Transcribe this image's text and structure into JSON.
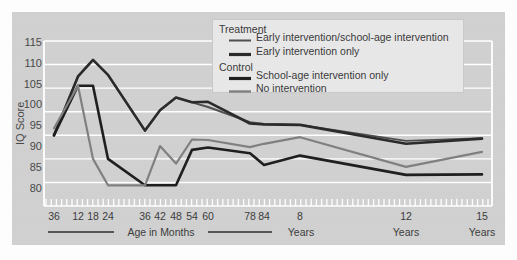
{
  "chart_data": {
    "type": "line",
    "title": "",
    "subtitle": "",
    "xlabel_groups": [
      "Age in Months",
      "Years",
      "Years",
      "Years"
    ],
    "ylabel": "IQ Score",
    "ylim": [
      80,
      115
    ],
    "yticks": [
      80,
      85,
      90,
      95,
      100,
      105,
      110,
      115
    ],
    "grid": "horizontal-white",
    "legend_position": "top-center",
    "x_tick_labels": [
      "36",
      "12",
      "18",
      "24",
      "36",
      "42",
      "48",
      "54",
      "60",
      "78",
      "84",
      "8",
      "12",
      "15"
    ],
    "x_tick_units": [
      "months",
      "months",
      "months",
      "months",
      "months",
      "months",
      "months",
      "months",
      "months",
      "months",
      "months",
      "years",
      "years",
      "years"
    ],
    "legend": {
      "groups": [
        {
          "heading": "Treatment",
          "entries": [
            {
              "label": "Early intervention/school-age intervention",
              "color": "#4f4f4f",
              "weight": 2.0
            },
            {
              "label": "Early intervention only",
              "color": "#2b2b2b",
              "weight": 3.0
            }
          ]
        },
        {
          "heading": "Control",
          "entries": [
            {
              "label": "School-age intervention only",
              "color": "#1f1f1f",
              "weight": 3.0
            },
            {
              "label": "No intervention",
              "color": "#808080",
              "weight": 2.2
            }
          ]
        }
      ]
    },
    "x": [
      "36m",
      "12",
      "18",
      "24",
      "36",
      "42",
      "48",
      "54",
      "60",
      "78",
      "84",
      "8y",
      "12y",
      "15y"
    ],
    "series": [
      {
        "name": "Early intervention/school-age intervention",
        "color": "#4f4f4f",
        "width": 1.9,
        "values": [
          95.0,
          107.5,
          111.0,
          107.8,
          96.0,
          100.3,
          103.0,
          102.0,
          101.0,
          97.8,
          97.4,
          97.2,
          93.8,
          94.4
        ]
      },
      {
        "name": "Early intervention only",
        "color": "#2b2b2b",
        "width": 2.6,
        "values": [
          95.0,
          107.5,
          111.0,
          107.8,
          96.0,
          100.3,
          103.0,
          102.0,
          102.1,
          97.5,
          97.3,
          97.2,
          93.2,
          94.3
        ]
      },
      {
        "name": "School-age intervention only",
        "color": "#1f1f1f",
        "width": 2.6,
        "values": [
          95.0,
          105.5,
          105.5,
          90.0,
          84.4,
          84.4,
          84.4,
          91.9,
          92.4,
          91.2,
          88.7,
          90.7,
          86.6,
          86.7
        ]
      },
      {
        "name": "No intervention",
        "color": "#808080",
        "width": 2.2,
        "values": [
          96.5,
          105.5,
          90.0,
          84.4,
          84.4,
          92.7,
          89.0,
          94.1,
          94.0,
          92.5,
          93.2,
          94.6,
          88.3,
          91.5
        ]
      }
    ],
    "x_positions": [
      54,
      78,
      93,
      108,
      145,
      160,
      176,
      192,
      208,
      250,
      264,
      300,
      406,
      482
    ],
    "axis_band_labels": [
      {
        "text": "Age in Months",
        "with_rule": true
      },
      {
        "text": "Years",
        "with_rule": false
      },
      {
        "text": "Years",
        "with_rule": false
      },
      {
        "text": "Years",
        "with_rule": false
      }
    ]
  },
  "colors": {
    "background": "#d2d2d2",
    "page": "#fdfdfd",
    "grid": "#ffffff",
    "legend_bg": "#e7e7e7",
    "text": "#3c3c3c"
  }
}
